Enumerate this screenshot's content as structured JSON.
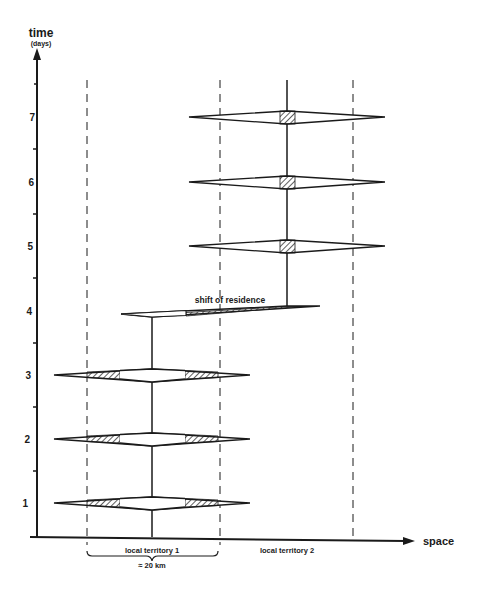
{
  "axes": {
    "y_label": "time",
    "y_unit": "(days)",
    "x_label": "space",
    "day_labels": [
      "1",
      "2",
      "3",
      "4",
      "5",
      "6",
      "7"
    ]
  },
  "territories": {
    "t1_label": "local territory 1",
    "t2_label": "local territory 2",
    "scale_label": "≈ 20 km"
  },
  "annotations": {
    "shift": "shift of residence"
  },
  "colors": {
    "ink": "#1a1a1a",
    "background": "#ffffff"
  }
}
